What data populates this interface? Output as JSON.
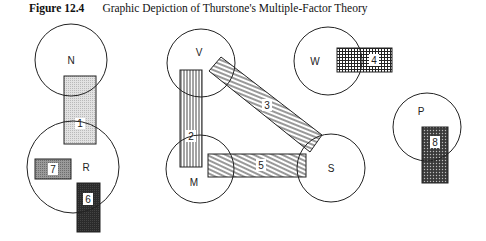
{
  "figure": {
    "number": "Figure 12.4",
    "title": "Graphic Depiction of Thurstone's Multiple-Factor Theory"
  },
  "abilities": [
    {
      "id": "N",
      "label": "N",
      "cx": 71,
      "cy": 60,
      "r": 36,
      "lx": 71,
      "ly": 60
    },
    {
      "id": "R",
      "label": "R",
      "cx": 73,
      "cy": 167,
      "r": 46,
      "lx": 86,
      "ly": 167
    },
    {
      "id": "V",
      "label": "V",
      "cx": 201,
      "cy": 63,
      "r": 34,
      "lx": 199,
      "ly": 53
    },
    {
      "id": "M",
      "label": "M",
      "cx": 200,
      "cy": 169,
      "r": 34,
      "lx": 194,
      "ly": 182
    },
    {
      "id": "W",
      "label": "W",
      "cx": 328,
      "cy": 61,
      "r": 34,
      "lx": 315,
      "ly": 61
    },
    {
      "id": "S",
      "label": "S",
      "cx": 331,
      "cy": 168,
      "r": 34,
      "lx": 331,
      "ly": 169
    },
    {
      "id": "P",
      "label": "P",
      "cx": 427,
      "cy": 127,
      "r": 34,
      "lx": 421,
      "ly": 111
    }
  ],
  "tasks": [
    {
      "id": "1",
      "label": "1",
      "pattern": "light-dots",
      "connects": [
        "N",
        "R"
      ]
    },
    {
      "id": "2",
      "label": "2",
      "pattern": "vertical-stripes",
      "connects": [
        "V",
        "M"
      ]
    },
    {
      "id": "3",
      "label": "3",
      "pattern": "diagonal-stripes",
      "connects": [
        "V",
        "S"
      ]
    },
    {
      "id": "4",
      "label": "4",
      "pattern": "crosshatch",
      "connects": [
        "W"
      ]
    },
    {
      "id": "5",
      "label": "5",
      "pattern": "diagonal-stripes",
      "connects": [
        "M",
        "S"
      ]
    },
    {
      "id": "6",
      "label": "6",
      "pattern": "dark-fill",
      "connects": [
        "R"
      ]
    },
    {
      "id": "7",
      "label": "7",
      "pattern": "medium-gray",
      "connects": [
        "R"
      ]
    },
    {
      "id": "8",
      "label": "8",
      "pattern": "dense-dots",
      "connects": [
        "P"
      ]
    }
  ],
  "colors": {
    "stroke": "#222222",
    "light": "#d6d6d6",
    "medium": "#8c8c8c",
    "dark": "#2b2b2b",
    "dense": "#555555"
  }
}
